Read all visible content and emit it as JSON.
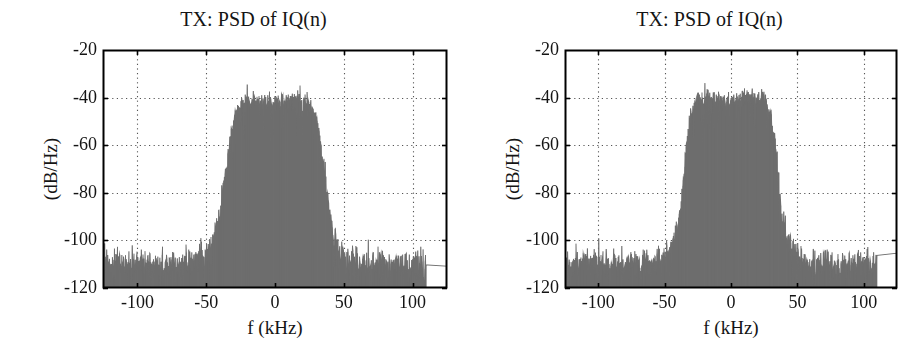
{
  "figure": {
    "background_color": "#ffffff",
    "width": 924,
    "height": 360,
    "panel_count": 2
  },
  "panels": [
    {
      "id": "left",
      "title": "TX: PSD of IQ(n)"
    },
    {
      "id": "right",
      "title": "TX: PSD of IQ(n)"
    }
  ],
  "chart_data": [
    {
      "type": "line",
      "title": "TX: PSD of IQ(n)",
      "xlabel": "f (kHz)",
      "ylabel": "(dB/Hz)",
      "xlim": [
        -125,
        125
      ],
      "ylim": [
        -120,
        -20
      ],
      "xticks": [
        -100,
        -50,
        0,
        50,
        100
      ],
      "xticklabels": [
        "-100",
        "-50",
        "0",
        "50",
        "100"
      ],
      "yticks": [
        -20,
        -40,
        -60,
        -80,
        -100,
        -120
      ],
      "yticklabels": [
        "-20",
        "-40",
        "-60",
        "-80",
        "-100",
        "-120"
      ],
      "grid": true,
      "grid_style": "dotted",
      "grid_color": "#555555",
      "axis_color": "#000000",
      "trace_color": "#6e6e6e",
      "legend": null,
      "series": [
        {
          "name": "PSD of IQ(n)",
          "description": "Noisy power spectral density of a transmitted IQ baseband signal: flat main lobe near -42 dB/Hz between about -33 and +33 kHz, steep skirts down to a -110 dB/Hz noise floor outside +/-45 kHz.",
          "noise_seed": 20413,
          "envelope_x": [
            -125,
            -110,
            -95,
            -80,
            -65,
            -55,
            -48,
            -44,
            -40,
            -36,
            -33,
            -30,
            -24,
            -16,
            -8,
            0,
            8,
            16,
            24,
            30,
            33,
            36,
            40,
            44,
            48,
            55,
            65,
            80,
            95,
            110,
            125
          ],
          "envelope_y": [
            -110,
            -110,
            -110,
            -110,
            -110,
            -108,
            -105,
            -99,
            -90,
            -72,
            -58,
            -48,
            -43,
            -41,
            -42,
            -43,
            -41,
            -41,
            -43,
            -48,
            -58,
            -72,
            -90,
            -99,
            -105,
            -108,
            -110,
            -110,
            -110,
            -110
          ],
          "noise_amp_x": [
            -125,
            -48,
            -40,
            -33,
            -20,
            0,
            20,
            33,
            40,
            48,
            125
          ],
          "noise_amp_y": [
            9,
            9,
            8,
            7,
            6,
            6,
            6,
            7,
            8,
            9,
            9
          ],
          "peak_db": -29,
          "floor_db": -120,
          "noise_floor_db": -110,
          "main_lobe_db": -42,
          "main_lobe_edges_khz": [
            -33,
            33
          ],
          "sample_count": 1024
        }
      ]
    },
    {
      "type": "line",
      "title": "TX: PSD of IQ(n)",
      "xlabel": "f (kHz)",
      "ylabel": "(dB/Hz)",
      "xlim": [
        -125,
        125
      ],
      "ylim": [
        -120,
        -20
      ],
      "xticks": [
        -100,
        -50,
        0,
        50,
        100
      ],
      "xticklabels": [
        "-100",
        "-50",
        "0",
        "50",
        "100"
      ],
      "yticks": [
        -20,
        -40,
        -60,
        -80,
        -100,
        -120
      ],
      "yticklabels": [
        "-20",
        "-40",
        "-60",
        "-80",
        "-100",
        "-120"
      ],
      "grid": true,
      "grid_style": "dotted",
      "grid_color": "#555555",
      "axis_color": "#000000",
      "trace_color": "#6e6e6e",
      "legend": null,
      "series": [
        {
          "name": "PSD of IQ(n)",
          "description": "Noisy power spectral density of a transmitted IQ baseband signal with steeper spectral skirts: flat main lobe near -42 dB/Hz between about -30 and +30 kHz, falling to a -110 dB/Hz noise floor beyond +/-40 kHz.",
          "noise_seed": 78129,
          "envelope_x": [
            -125,
            -110,
            -95,
            -80,
            -65,
            -55,
            -48,
            -44,
            -40,
            -37,
            -34,
            -30,
            -26,
            -18,
            -9,
            0,
            9,
            18,
            26,
            30,
            34,
            37,
            40,
            44,
            48,
            55,
            65,
            80,
            95,
            110,
            125
          ],
          "envelope_y": [
            -110,
            -110,
            -110,
            -110,
            -110,
            -109,
            -106,
            -101,
            -95,
            -82,
            -62,
            -47,
            -42,
            -40,
            -42,
            -43,
            -40,
            -40,
            -42,
            -47,
            -62,
            -82,
            -95,
            -101,
            -106,
            -109,
            -110,
            -110,
            -110,
            -110
          ],
          "noise_amp_x": [
            -125,
            -48,
            -40,
            -34,
            -20,
            0,
            20,
            34,
            40,
            48,
            125
          ],
          "noise_amp_y": [
            9,
            9,
            8,
            7,
            6,
            6,
            6,
            7,
            8,
            9,
            9
          ],
          "peak_db": -29,
          "floor_db": -120,
          "noise_floor_db": -110,
          "main_lobe_db": -42,
          "main_lobe_edges_khz": [
            -30,
            30
          ],
          "sample_count": 1024
        }
      ]
    }
  ],
  "geometry": {
    "panels": [
      {
        "plot_left": 103,
        "plot_top": 50,
        "plot_width": 344,
        "plot_height": 238
      },
      {
        "plot_left": 565,
        "plot_top": 50,
        "plot_width": 332,
        "plot_height": 238
      }
    ]
  }
}
